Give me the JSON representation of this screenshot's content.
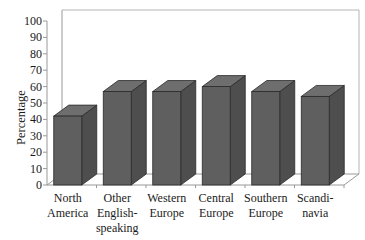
{
  "chart_data": {
    "type": "bar",
    "style": "3d-column",
    "title": "",
    "xlabel": "",
    "ylabel": "Percentage",
    "ylim": [
      0,
      100
    ],
    "yticks": [
      0,
      10,
      20,
      30,
      40,
      50,
      60,
      70,
      80,
      90,
      100
    ],
    "grid": false,
    "legend": null,
    "categories": [
      "North America",
      "Other English-speaking",
      "Western Europe",
      "Central Europe",
      "Southern Europe",
      "Scandinavia"
    ],
    "category_labels_display": [
      [
        "North",
        "America"
      ],
      [
        "Other",
        "English-",
        "speaking"
      ],
      [
        "Western",
        "Europe"
      ],
      [
        "Central",
        "Europe"
      ],
      [
        "Southern",
        "Europe"
      ],
      [
        "Scandi-",
        "navia"
      ]
    ],
    "values": [
      42,
      57,
      57,
      60,
      57,
      54
    ],
    "colors": {
      "bar_front": "#5f5f5f",
      "bar_side": "#4e4e4e",
      "bar_top": "#6e6e6e",
      "axis": "#999999",
      "edge": "#2a2a2a"
    }
  }
}
